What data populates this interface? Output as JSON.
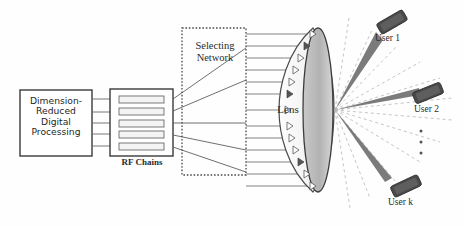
{
  "figure": {
    "background_color": "#ffffff",
    "line_color": "#555555",
    "beam_color": "#7d7d7d",
    "ray_color": "#b9b9b9",
    "device_color": "#4a4a4a"
  },
  "blocks": {
    "dsp": {
      "label": "Dimension-\nReduced\nDigital\nProcessing",
      "lines": [
        "Dimension-",
        "Reduced",
        "Digital",
        "Processing"
      ],
      "x": 20,
      "y": 90,
      "w": 72,
      "h": 66
    },
    "rf_chains": {
      "caption": "RF Chains",
      "x": 110,
      "y": 89,
      "w": 63,
      "h": 67,
      "chain_count": 5
    },
    "selecting_network": {
      "label": "Selecting\nNetwork",
      "lines": [
        "Selecting",
        "Network"
      ],
      "x": 182,
      "y": 28,
      "w": 64,
      "h": 147,
      "border": "dashed"
    },
    "lens": {
      "label": "Lens",
      "cx": 305,
      "cy": 110,
      "feed_count": 13
    }
  },
  "users": [
    {
      "label": "User 1",
      "x": 392,
      "y": 22,
      "rotation": -30
    },
    {
      "label": "User 2",
      "x": 428,
      "y": 93,
      "rotation": -22
    },
    {
      "label": "User k",
      "x": 406,
      "y": 186,
      "rotation": -25
    }
  ],
  "ellipsis": {
    "dots": 3,
    "x": 421,
    "y": 132
  },
  "beams": {
    "count": 3,
    "origin_x": 335,
    "origin_y": 110
  },
  "rays": {
    "count": 12,
    "style": "dashed"
  }
}
